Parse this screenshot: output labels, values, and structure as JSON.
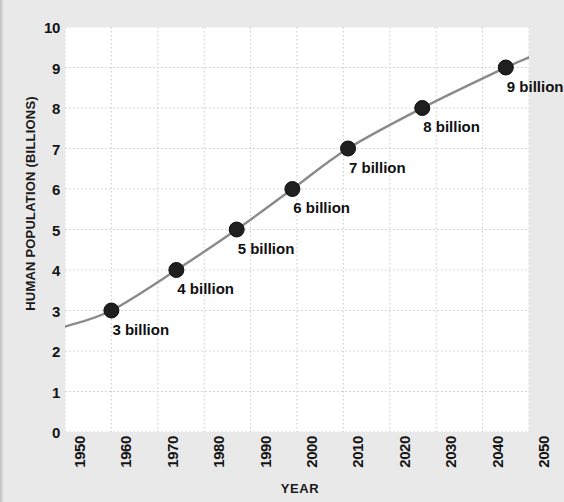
{
  "chart_data": {
    "type": "line",
    "title": "",
    "xlabel": "YEAR",
    "ylabel": "HUMAN POPULATION (BILLIONS)",
    "xlim": [
      1950,
      2050
    ],
    "ylim": [
      0,
      10
    ],
    "grid": true,
    "legend": "none",
    "xticks": [
      "1950",
      "1960",
      "1970",
      "1980",
      "1990",
      "2000",
      "2010",
      "2020",
      "2030",
      "2040",
      "2050"
    ],
    "yticks": [
      "0",
      "1",
      "2",
      "3",
      "4",
      "5",
      "6",
      "7",
      "8",
      "9",
      "10"
    ],
    "line_color": "#8a8a8a",
    "marker_color": "#1f1f1f",
    "background_color": "#e9e9e9",
    "plot_background_color": "#ffffff",
    "gridline_color": "#c9c9c9",
    "series": [
      {
        "name": "Human population",
        "x": [
          1950,
          1960,
          1974,
          1987,
          1999,
          2011,
          2027,
          2045,
          2050
        ],
        "y": [
          2.6,
          3.0,
          4.0,
          5.0,
          6.0,
          7.0,
          8.0,
          9.0,
          9.25
        ]
      }
    ],
    "points": [
      {
        "x": 1960,
        "y": 3,
        "label": "3 billion"
      },
      {
        "x": 1974,
        "y": 4,
        "label": "4 billion"
      },
      {
        "x": 1987,
        "y": 5,
        "label": "5 billion"
      },
      {
        "x": 1999,
        "y": 6,
        "label": "6 billion"
      },
      {
        "x": 2011,
        "y": 7,
        "label": "7 billion"
      },
      {
        "x": 2027,
        "y": 8,
        "label": "8 billion"
      },
      {
        "x": 2045,
        "y": 9,
        "label": "9 billion"
      }
    ]
  }
}
